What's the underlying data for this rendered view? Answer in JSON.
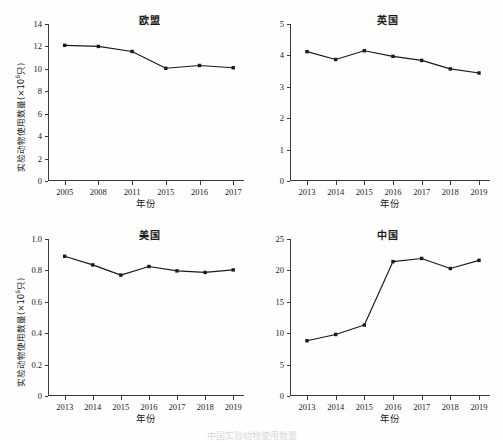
{
  "figure": {
    "axis_x_title": "年份",
    "axis_y_title_main": "实验动物使用数量(×10",
    "axis_y_title_sup": "6",
    "axis_y_title_tail": "只)",
    "caption": "中国实验动物使用数量"
  },
  "chart_data": [
    {
      "type": "line",
      "title": "欧盟",
      "panel": "top-left",
      "xlabel": "年份",
      "ylabel": "实验动物使用数量(×10⁶只)",
      "categories": [
        "2005",
        "2008",
        "2011",
        "2015",
        "2016",
        "2017"
      ],
      "values": [
        12.1,
        12.0,
        11.55,
        10.05,
        10.3,
        10.1
      ],
      "yticks": [
        "0",
        "2",
        "4",
        "6",
        "8",
        "10",
        "12",
        "14"
      ],
      "ytick_values": [
        0,
        2,
        4,
        6,
        8,
        10,
        12,
        14
      ],
      "ylim": [
        0,
        14
      ],
      "grid": false,
      "legend": "none",
      "marker": "square",
      "color": "#1a1a1a"
    },
    {
      "type": "line",
      "title": "英国",
      "panel": "top-right",
      "xlabel": "年份",
      "ylabel": "",
      "categories": [
        "2013",
        "2014",
        "2015",
        "2016",
        "2017",
        "2018",
        "2019"
      ],
      "values": [
        4.12,
        3.87,
        4.15,
        3.97,
        3.84,
        3.57,
        3.44
      ],
      "yticks": [
        "0",
        "1",
        "2",
        "3",
        "4",
        "5"
      ],
      "ytick_values": [
        0,
        1,
        2,
        3,
        4,
        5
      ],
      "ylim": [
        0,
        5
      ],
      "grid": false,
      "legend": "none",
      "marker": "square",
      "color": "#1a1a1a"
    },
    {
      "type": "line",
      "title": "美国",
      "panel": "bottom-left",
      "xlabel": "年份",
      "ylabel": "实验动物使用数量(×10⁶只)",
      "categories": [
        "2013",
        "2014",
        "2015",
        "2016",
        "2017",
        "2018",
        "2019"
      ],
      "values": [
        0.89,
        0.835,
        0.77,
        0.825,
        0.797,
        0.787,
        0.803
      ],
      "yticks": [
        "0",
        "0.2",
        "0.4",
        "0.6",
        "0.8",
        "1.0"
      ],
      "ytick_values": [
        0,
        0.2,
        0.4,
        0.6,
        0.8,
        1.0
      ],
      "ylim": [
        0,
        1.0
      ],
      "grid": false,
      "legend": "none",
      "marker": "square",
      "color": "#1a1a1a"
    },
    {
      "type": "line",
      "title": "中国",
      "panel": "bottom-right",
      "xlabel": "年份",
      "ylabel": "",
      "categories": [
        "2013",
        "2014",
        "2015",
        "2016",
        "2017",
        "2018",
        "2019"
      ],
      "values": [
        8.8,
        9.8,
        11.3,
        21.4,
        21.9,
        20.3,
        21.6
      ],
      "yticks": [
        "0",
        "5",
        "10",
        "15",
        "20",
        "25"
      ],
      "ytick_values": [
        0,
        5,
        10,
        15,
        20,
        25
      ],
      "ylim": [
        0,
        25
      ],
      "grid": false,
      "legend": "none",
      "marker": "square",
      "color": "#1a1a1a"
    }
  ]
}
